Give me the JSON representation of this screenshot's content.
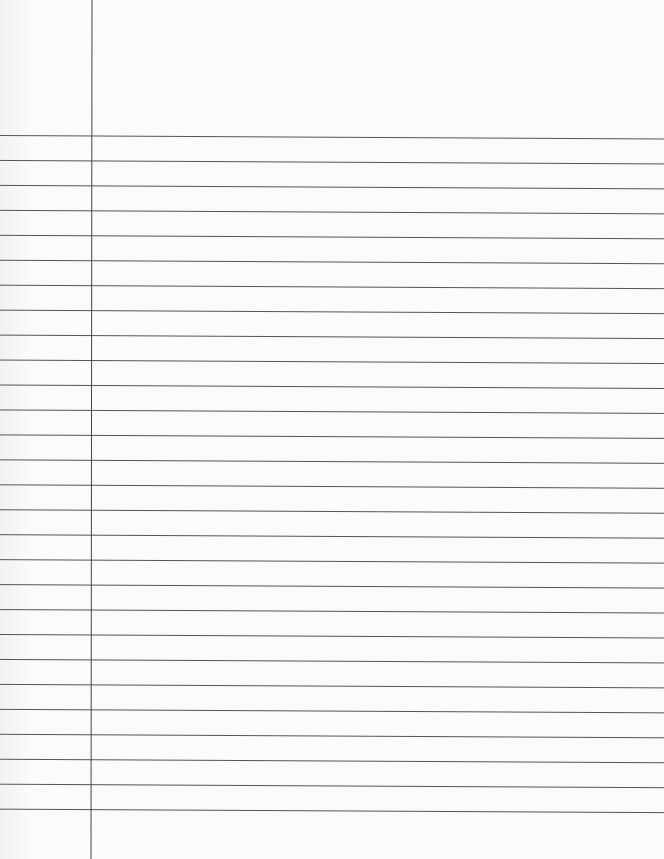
{
  "page": {
    "type": "ruled notebook paper",
    "ruled_line_count": 28,
    "has_margin_line": true,
    "colors": {
      "paper": "#fbfbfb",
      "rule": "#555555",
      "margin": "#444444"
    }
  }
}
